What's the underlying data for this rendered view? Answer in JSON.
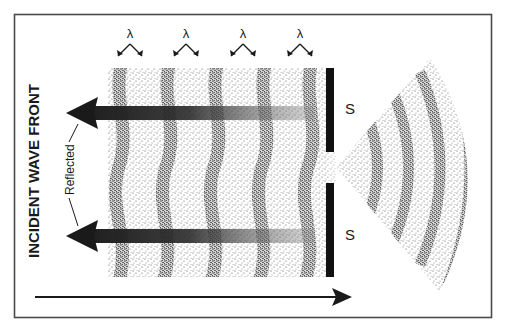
{
  "diagram": {
    "title_vertical": "INCIDENT WAVE FRONT",
    "reflected_label": "Reflected",
    "wavelength_symbol": "λ",
    "wavelength_labels": [
      "λ",
      "λ",
      "λ",
      "λ"
    ],
    "barrier_labels": [
      "S",
      "S"
    ],
    "colors": {
      "ink": "#1a1a1a",
      "frame": "#4a4a4a",
      "background": "#ffffff",
      "stipple": "#222222"
    },
    "elements": {
      "incident_region": "stippled rectangle with curved wave bands",
      "barrier": "vertical black bar with a central slit",
      "diffracted_region": "fan-shaped stippled region with concentric arcs",
      "reflected_arrows": 2,
      "incident_direction_arrow": "left-to-right arrow at bottom"
    }
  }
}
